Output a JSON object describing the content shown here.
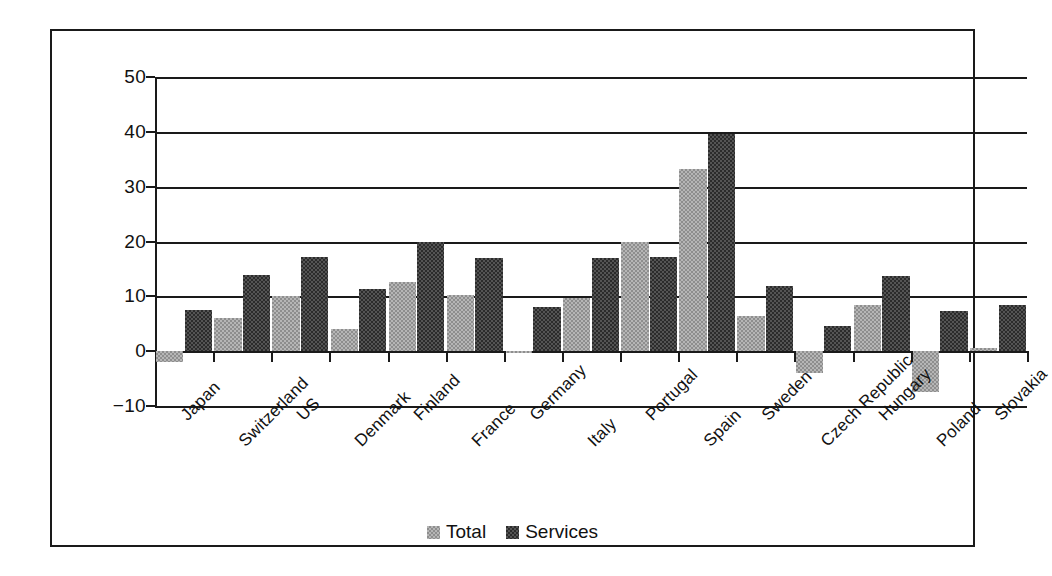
{
  "chart_data": {
    "type": "bar",
    "title": "",
    "subtitle": "",
    "xlabel": "",
    "ylabel": "",
    "ylim": [
      -10,
      50
    ],
    "yticks": [
      50,
      40,
      30,
      20,
      10,
      0,
      -10
    ],
    "ytick_labels": [
      "50",
      "40",
      "30",
      "20",
      "10",
      "0",
      "−10"
    ],
    "grid": true,
    "grid_axis": "y",
    "legend_position": "bottom-center",
    "categories": [
      "Japan",
      "Switzerland",
      "US",
      "Denmark",
      "Finland",
      "France",
      "Germany",
      "Italy",
      "Portugal",
      "Spain",
      "Sweden",
      "Czech Republic",
      "Hungary",
      "Poland",
      "Slovakia"
    ],
    "series": [
      {
        "name": "Total",
        "color": "#b6b6b6",
        "values": [
          -2.0,
          6.0,
          10.0,
          4.0,
          12.7,
          10.2,
          -0.3,
          9.7,
          19.9,
          33.2,
          6.4,
          -4.0,
          8.4,
          -7.5,
          0.5
        ]
      },
      {
        "name": "Services",
        "color": "#2b2b2b",
        "values": [
          7.5,
          13.8,
          17.2,
          11.4,
          19.9,
          16.9,
          8.1,
          16.9,
          17.2,
          39.6,
          11.8,
          4.5,
          13.7,
          7.3,
          8.5
        ]
      }
    ]
  },
  "legend": {
    "entries": [
      {
        "label": "Total",
        "swatch": "total"
      },
      {
        "label": "Services",
        "swatch": "services"
      }
    ]
  }
}
